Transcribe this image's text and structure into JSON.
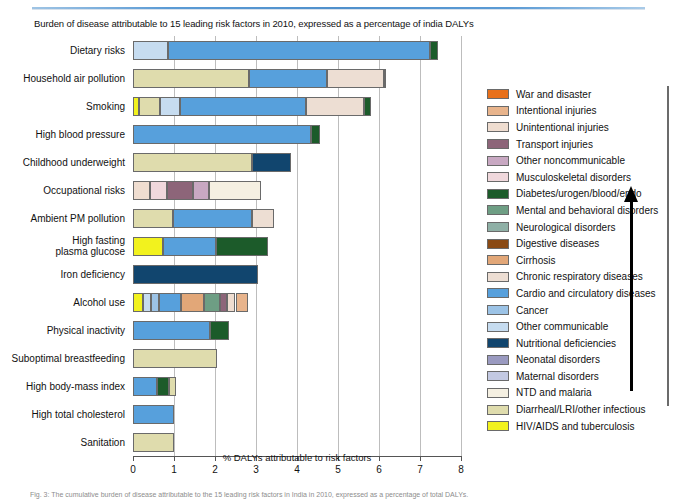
{
  "chart_title": "Burden of disease attributable to 15 leading risk factors in 2010, expressed as a percentage of india DALYs",
  "caption": "Fig. 3: The cumulative burden of disease attributable to the 15 leading risk factors in India in 2010, expressed as a percentage of total DALYs.",
  "arrow_icon": "up-arrow-icon",
  "chart_data": {
    "type": "bar",
    "orientation": "horizontal",
    "stacked": true,
    "title": "Burden of disease attributable to 15 leading risk factors in 2010, expressed as a percentage of india DALYs",
    "xlabel": "% DALYs attributable to risk factors",
    "ylabel": "",
    "xlim": [
      0,
      8
    ],
    "xticks": [
      0,
      1,
      2,
      3,
      4,
      5,
      6,
      7,
      8
    ],
    "xtick_labels": [
      "0",
      "1",
      "2",
      "3",
      "4",
      "5",
      "6",
      "7",
      "8"
    ],
    "grid": true,
    "legend_position": "right",
    "categories": [
      "Dietary risks",
      "Household air pollution",
      "Smoking",
      "High blood pressure",
      "Childhood underweight",
      "Occupational risks",
      "Ambient PM pollution",
      "High fasting plasma glucose",
      "Iron deficiency",
      "Alcohol use",
      "Physical inactivity",
      "Suboptimal breastfeeding",
      "High body-mass index",
      "High total cholesterol",
      "Sanitation"
    ],
    "totals": [
      7.45,
      6.12,
      5.8,
      4.55,
      3.85,
      3.55,
      3.45,
      3.3,
      3.05,
      2.8,
      2.35,
      2.05,
      1.05,
      1.0,
      1.0
    ],
    "series": [
      {
        "name": "War and disaster",
        "color": "#E8701A",
        "values": [
          0,
          0,
          0,
          0,
          0,
          0,
          0,
          0,
          0,
          0,
          0,
          0,
          0,
          0,
          0
        ]
      },
      {
        "name": "Intentional injuries",
        "color": "#E8B48C",
        "values": [
          0,
          0,
          0,
          0,
          0,
          0,
          0,
          0,
          0,
          0.3,
          0,
          0,
          0,
          0,
          0
        ]
      },
      {
        "name": "Unintentional injuries",
        "color": "#EFDDD0",
        "values": [
          0,
          0,
          0,
          0,
          0,
          0.42,
          0,
          0,
          0,
          0,
          0,
          0,
          0,
          0,
          0
        ]
      },
      {
        "name": "Transport injuries",
        "color": "#8D6579",
        "values": [
          0,
          0.06,
          0,
          0,
          0,
          0.62,
          0,
          0,
          0,
          0.18,
          0,
          0,
          0,
          0,
          0
        ]
      },
      {
        "name": "Other noncommunicable",
        "color": "#C8A8C2",
        "values": [
          0,
          0,
          0,
          0,
          0,
          0.4,
          0,
          0,
          0,
          0,
          0,
          0,
          0,
          0,
          0
        ]
      },
      {
        "name": "Musculoskeletal disorders",
        "color": "#F0D8DC",
        "values": [
          0,
          0,
          0,
          0,
          0,
          0.42,
          0,
          0,
          0,
          0,
          0,
          0,
          0,
          0,
          0
        ]
      },
      {
        "name": "Diabetes/urogen/blood/endo",
        "color": "#1C5B2A",
        "values": [
          0.2,
          0,
          0.17,
          0.2,
          0,
          0,
          0,
          1.28,
          0,
          0,
          0.48,
          0,
          0.3,
          0,
          0
        ]
      },
      {
        "name": "Mental and behavioral disorders",
        "color": "#6E9E84",
        "values": [
          0,
          0,
          0,
          0,
          0,
          0,
          0,
          0,
          0,
          0.38,
          0,
          0,
          0,
          0,
          0
        ]
      },
      {
        "name": "Neurological disorders",
        "color": "#8FB0A6",
        "values": [
          0,
          0,
          0,
          0,
          0,
          0,
          0,
          0,
          0,
          0,
          0,
          0,
          0,
          0,
          0
        ]
      },
      {
        "name": "Digestive diseases",
        "color": "#8A4A14",
        "values": [
          0,
          0,
          0,
          0,
          0,
          0,
          0,
          0,
          0,
          0,
          0,
          0,
          0,
          0,
          0
        ]
      },
      {
        "name": "Cirrhosis",
        "color": "#E2A778",
        "values": [
          0,
          0,
          0,
          0,
          0,
          0,
          0,
          0,
          0,
          0.55,
          0,
          0,
          0,
          0,
          0
        ]
      },
      {
        "name": "Chronic respiratory diseases",
        "color": "#EDDED3",
        "values": [
          0,
          1.38,
          1.42,
          0,
          0,
          0,
          0.55,
          0,
          0,
          0,
          0,
          0,
          0,
          0,
          0
        ]
      },
      {
        "name": "Cardio and circulatory diseases",
        "color": "#57A0DC",
        "values": [
          6.4,
          1.92,
          3.07,
          4.35,
          0,
          0,
          1.92,
          1.3,
          0,
          0.55,
          1.87,
          0,
          0.58,
          1.0,
          0
        ]
      },
      {
        "name": "Cancer",
        "color": "#9CC3E6",
        "values": [
          0,
          0,
          0,
          0,
          0,
          0,
          0,
          0,
          0,
          0.18,
          0,
          0,
          0,
          0,
          0
        ]
      },
      {
        "name": "Other communicable",
        "color": "#C6DCF0",
        "values": [
          0.85,
          0,
          0.5,
          0,
          0,
          0,
          0,
          0,
          0,
          0.2,
          0,
          0,
          0,
          0,
          0
        ]
      },
      {
        "name": "Nutritional deficiencies",
        "color": "#11456E",
        "values": [
          0,
          0,
          0,
          0,
          0.95,
          0,
          0,
          0,
          3.05,
          0,
          0,
          0,
          0,
          0,
          0
        ]
      },
      {
        "name": "Neonatal disorders",
        "color": "#9A9AC0",
        "values": [
          0,
          0,
          0,
          0,
          0,
          0,
          0,
          0,
          0,
          0,
          0,
          0,
          0,
          0,
          0
        ]
      },
      {
        "name": "Maternal disorders",
        "color": "#C3C9E2",
        "values": [
          0,
          0,
          0,
          0,
          0,
          0,
          0,
          0,
          0,
          0,
          0,
          0,
          0,
          0,
          0
        ]
      },
      {
        "name": "NTD and malaria",
        "color": "#F5F0E2",
        "values": [
          0,
          0,
          0,
          0,
          0,
          1.25,
          0,
          0,
          0,
          0,
          0,
          0,
          0,
          0,
          0
        ]
      },
      {
        "name": "Diarrheal/LRI/other infectious",
        "color": "#DFDCAD",
        "values": [
          0,
          2.82,
          0.5,
          0,
          2.9,
          0,
          0.98,
          0,
          0,
          0,
          0,
          2.05,
          0.17,
          0,
          1.0
        ]
      },
      {
        "name": "HIV/AIDS and tuberculosis",
        "color": "#F2F21E",
        "values": [
          0,
          0,
          0.15,
          0,
          0,
          0,
          0,
          0.72,
          0,
          0.25,
          0,
          0,
          0,
          0,
          0
        ]
      }
    ],
    "bars": [
      {
        "category": "Dietary risks",
        "total": 7.45,
        "segments": [
          {
            "series": "Other communicable",
            "value": 0.85
          },
          {
            "series": "Cardio and circulatory diseases",
            "value": 6.4
          },
          {
            "series": "Diabetes/urogen/blood/endo",
            "value": 0.2
          }
        ]
      },
      {
        "category": "Household air pollution",
        "total": 6.12,
        "segments": [
          {
            "series": "Diarrheal/LRI/other infectious",
            "value": 2.82
          },
          {
            "series": "Cardio and circulatory diseases",
            "value": 1.92
          },
          {
            "series": "Chronic respiratory diseases",
            "value": 1.38
          },
          {
            "series": "Transport injuries",
            "value": 0.06
          }
        ]
      },
      {
        "category": "Smoking",
        "total": 5.8,
        "segments": [
          {
            "series": "HIV/AIDS and tuberculosis",
            "value": 0.15
          },
          {
            "series": "Diarrheal/LRI/other infectious",
            "value": 0.5
          },
          {
            "series": "Other communicable",
            "value": 0.5
          },
          {
            "series": "Cardio and circulatory diseases",
            "value": 3.07
          },
          {
            "series": "Chronic respiratory diseases",
            "value": 1.42
          },
          {
            "series": "Diabetes/urogen/blood/endo",
            "value": 0.17
          }
        ]
      },
      {
        "category": "High blood pressure",
        "total": 4.55,
        "segments": [
          {
            "series": "Cardio and circulatory diseases",
            "value": 4.35
          },
          {
            "series": "Diabetes/urogen/blood/endo",
            "value": 0.2
          }
        ]
      },
      {
        "category": "Childhood underweight",
        "total": 3.85,
        "segments": [
          {
            "series": "Diarrheal/LRI/other infectious",
            "value": 2.9
          },
          {
            "series": "Nutritional deficiencies",
            "value": 0.95
          }
        ]
      },
      {
        "category": "Occupational risks",
        "total": 3.55,
        "segments": [
          {
            "series": "Unintentional injuries",
            "value": 0.42
          },
          {
            "series": "Musculoskeletal disorders",
            "value": 0.42
          },
          {
            "series": "Transport injuries",
            "value": 0.62
          },
          {
            "series": "Other noncommunicable",
            "value": 0.4
          },
          {
            "series": "NTD and malaria",
            "value": 1.25
          }
        ]
      },
      {
        "category": "Ambient PM pollution",
        "total": 3.45,
        "segments": [
          {
            "series": "Diarrheal/LRI/other infectious",
            "value": 0.98
          },
          {
            "series": "Cardio and circulatory diseases",
            "value": 1.92
          },
          {
            "series": "Chronic respiratory diseases",
            "value": 0.55
          }
        ]
      },
      {
        "category": "High fasting plasma glucose",
        "total": 3.3,
        "segments": [
          {
            "series": "HIV/AIDS and tuberculosis",
            "value": 0.72
          },
          {
            "series": "Cardio and circulatory diseases",
            "value": 1.3
          },
          {
            "series": "Diabetes/urogen/blood/endo",
            "value": 1.28
          }
        ]
      },
      {
        "category": "Iron deficiency",
        "total": 3.05,
        "segments": [
          {
            "series": "Nutritional deficiencies",
            "value": 3.05
          }
        ]
      },
      {
        "category": "Alcohol use",
        "total": 2.8,
        "segments": [
          {
            "series": "HIV/AIDS and tuberculosis",
            "value": 0.25
          },
          {
            "series": "Other communicable",
            "value": 0.2
          },
          {
            "series": "Cancer",
            "value": 0.18
          },
          {
            "series": "Cardio and circulatory diseases",
            "value": 0.55
          },
          {
            "series": "Cirrhosis",
            "value": 0.55
          },
          {
            "series": "Mental and behavioral disorders",
            "value": 0.38
          },
          {
            "series": "Transport injuries",
            "value": 0.18
          },
          {
            "series": "Unintentional injuries",
            "value": 0.21
          },
          {
            "series": "Intentional injuries",
            "value": 0.3
          }
        ]
      },
      {
        "category": "Physical inactivity",
        "total": 2.35,
        "segments": [
          {
            "series": "Cardio and circulatory diseases",
            "value": 1.87
          },
          {
            "series": "Diabetes/urogen/blood/endo",
            "value": 0.48
          }
        ]
      },
      {
        "category": "Suboptimal breastfeeding",
        "total": 2.05,
        "segments": [
          {
            "series": "Diarrheal/LRI/other infectious",
            "value": 2.05
          }
        ]
      },
      {
        "category": "High body-mass index",
        "total": 1.05,
        "segments": [
          {
            "series": "Cardio and circulatory diseases",
            "value": 0.58
          },
          {
            "series": "Diabetes/urogen/blood/endo",
            "value": 0.3
          },
          {
            "series": "Diarrheal/LRI/other infectious",
            "value": 0.17
          }
        ]
      },
      {
        "category": "High total cholesterol",
        "total": 1.0,
        "segments": [
          {
            "series": "Cardio and circulatory diseases",
            "value": 1.0
          }
        ]
      },
      {
        "category": "Sanitation",
        "total": 1.0,
        "segments": [
          {
            "series": "Diarrheal/LRI/other infectious",
            "value": 1.0
          }
        ]
      }
    ]
  }
}
